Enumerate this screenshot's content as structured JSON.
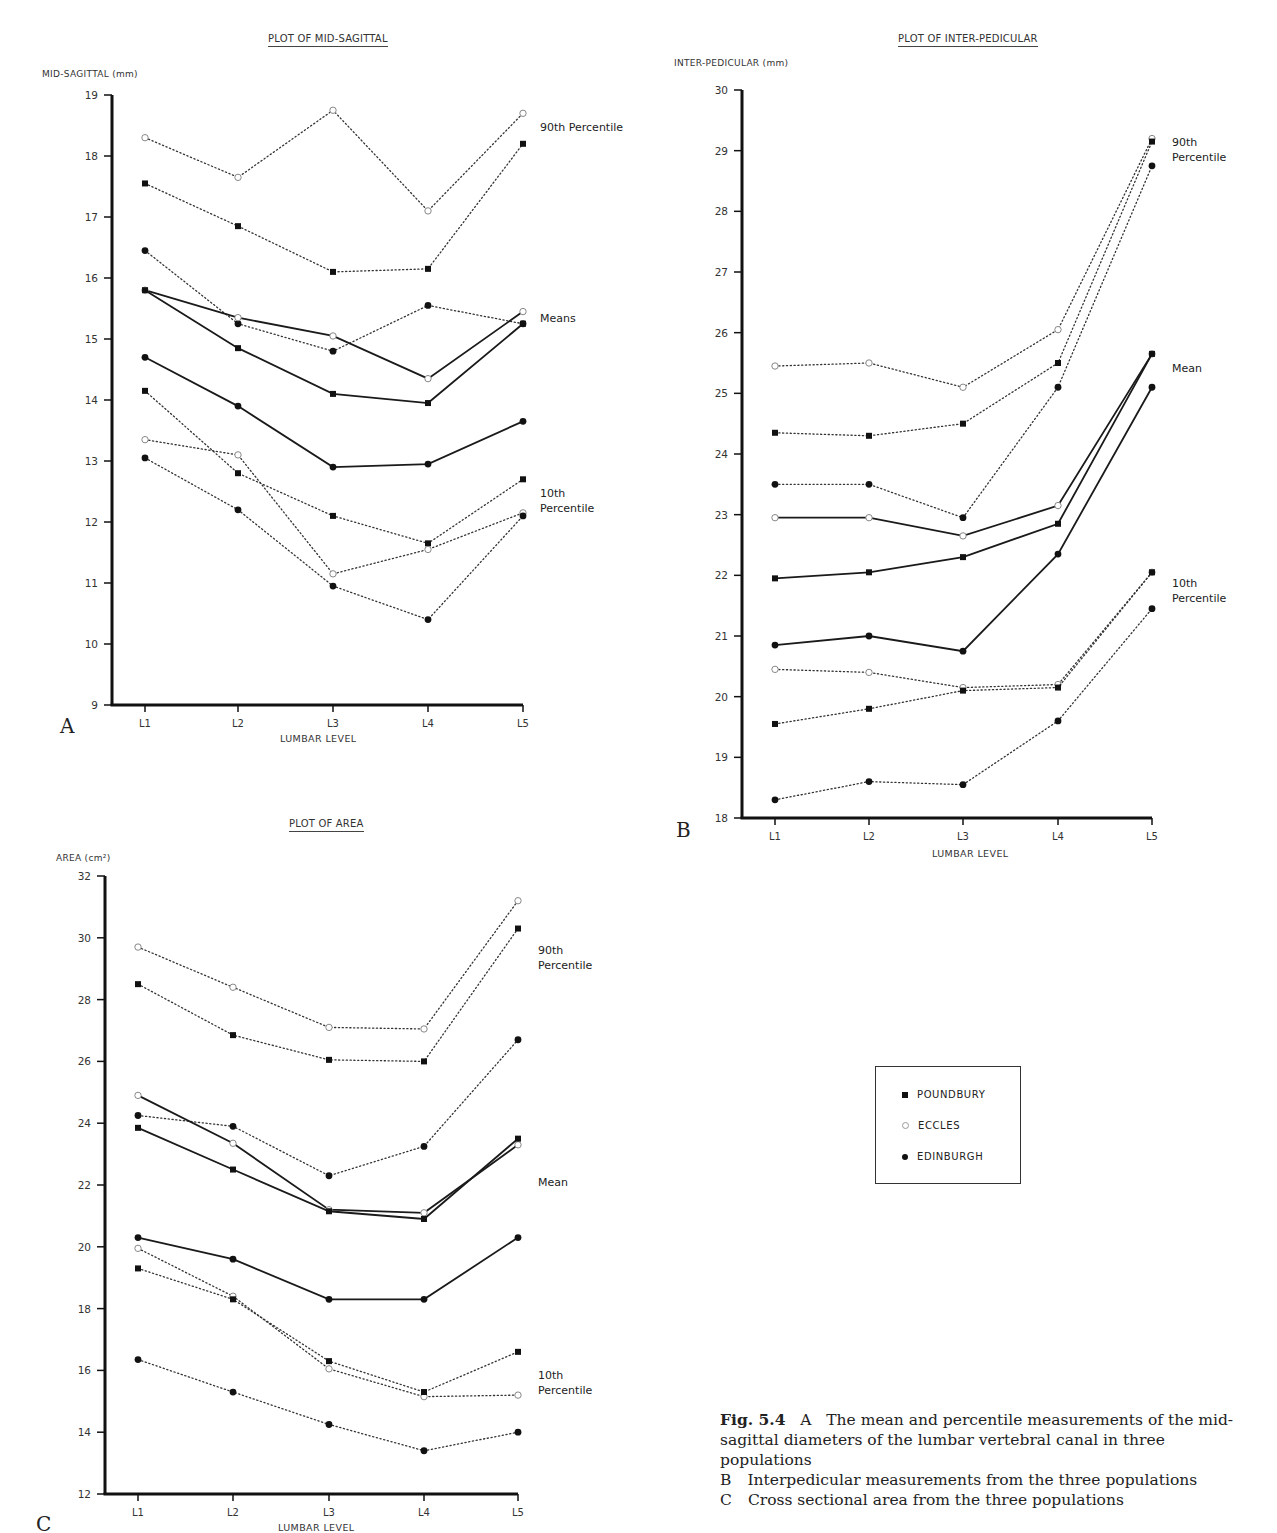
{
  "figure": {
    "caption": {
      "figure_label": "Fig. 5.4",
      "line_a_letter": "A",
      "line_a": "The mean and percentile measurements of the mid-sagittal diameters of the lumbar vertebral canal in three populations",
      "line_b_letter": "B",
      "line_b": "Interpedicular measurements from the three populations",
      "line_c_letter": "C",
      "line_c": "Cross sectional area from the three populations"
    },
    "legend": {
      "items": [
        {
          "label": "POUNDBURY",
          "marker": "filled-square"
        },
        {
          "label": "ECCLES",
          "marker": "open-circle"
        },
        {
          "label": "EDINBURGH",
          "marker": "filled-circle"
        }
      ]
    }
  },
  "chart_data": [
    {
      "id": "A",
      "type": "line",
      "title": "PLOT OF MID-SAGITTAL",
      "panel_letter": "A",
      "xlabel": "LUMBAR LEVEL",
      "ylabel": "MID-SAGITTAL (mm)",
      "categories": [
        "L1",
        "L2",
        "L3",
        "L4",
        "L5"
      ],
      "ylim": [
        9,
        19
      ],
      "yticks": [
        9,
        10,
        11,
        12,
        13,
        14,
        15,
        16,
        17,
        18,
        19
      ],
      "grid": false,
      "annotations": [
        {
          "text": "90th Percentile",
          "x": 540,
          "y": 120
        },
        {
          "text": "Means",
          "x": 540,
          "y": 311
        },
        {
          "text": "10th\nPercentile",
          "x": 540,
          "y": 486
        }
      ],
      "series": [
        {
          "name": "Eccles 90th Percentile",
          "population": "ECCLES",
          "stat": "90th",
          "style": "dotted",
          "marker": "open-circle",
          "values": [
            18.3,
            17.65,
            18.75,
            17.1,
            18.7
          ]
        },
        {
          "name": "Poundbury 90th Percentile",
          "population": "POUNDBURY",
          "stat": "90th",
          "style": "dotted",
          "marker": "filled-square",
          "values": [
            17.55,
            16.85,
            16.1,
            16.15,
            18.2
          ]
        },
        {
          "name": "Edinburgh 90th Percentile",
          "population": "EDINBURGH",
          "stat": "90th",
          "style": "dotted",
          "marker": "filled-circle",
          "values": [
            16.45,
            15.25,
            14.8,
            15.55,
            15.25
          ]
        },
        {
          "name": "Eccles Mean",
          "population": "ECCLES",
          "stat": "mean",
          "style": "solid",
          "marker": "open-circle",
          "values": [
            15.8,
            15.35,
            15.05,
            14.35,
            15.45
          ]
        },
        {
          "name": "Poundbury Mean",
          "population": "POUNDBURY",
          "stat": "mean",
          "style": "solid",
          "marker": "filled-square",
          "values": [
            15.8,
            14.85,
            14.1,
            13.95,
            15.25
          ]
        },
        {
          "name": "Edinburgh Mean",
          "population": "EDINBURGH",
          "stat": "mean",
          "style": "solid",
          "marker": "filled-circle",
          "values": [
            14.7,
            13.9,
            12.9,
            12.95,
            13.65
          ]
        },
        {
          "name": "Poundbury 10th Percentile",
          "population": "POUNDBURY",
          "stat": "10th",
          "style": "dotted",
          "marker": "filled-square",
          "values": [
            14.15,
            12.8,
            12.1,
            11.65,
            12.7
          ]
        },
        {
          "name": "Eccles 10th Percentile",
          "population": "ECCLES",
          "stat": "10th",
          "style": "dotted",
          "marker": "open-circle",
          "values": [
            13.35,
            13.1,
            11.15,
            11.55,
            12.15
          ]
        },
        {
          "name": "Edinburgh 10th Percentile",
          "population": "EDINBURGH",
          "stat": "10th",
          "style": "dotted",
          "marker": "filled-circle",
          "values": [
            13.05,
            12.2,
            10.95,
            10.4,
            12.1
          ]
        }
      ]
    },
    {
      "id": "B",
      "type": "line",
      "title": "PLOT OF INTER-PEDICULAR",
      "panel_letter": "B",
      "xlabel": "LUMBAR LEVEL",
      "ylabel": "INTER-PEDICULAR (mm)",
      "categories": [
        "L1",
        "L2",
        "L3",
        "L4",
        "L5"
      ],
      "ylim": [
        18,
        30
      ],
      "yticks": [
        18,
        19,
        20,
        21,
        22,
        23,
        24,
        25,
        26,
        27,
        28,
        29,
        30
      ],
      "grid": false,
      "annotations": [
        {
          "text": "90th\nPercentile",
          "x": 1172,
          "y": 135
        },
        {
          "text": "Mean",
          "x": 1172,
          "y": 361
        },
        {
          "text": "10th\nPercentile",
          "x": 1172,
          "y": 576
        }
      ],
      "series": [
        {
          "name": "Eccles 90th Percentile",
          "population": "ECCLES",
          "stat": "90th",
          "style": "dotted",
          "marker": "open-circle",
          "values": [
            25.45,
            25.5,
            25.1,
            26.05,
            29.2
          ]
        },
        {
          "name": "Poundbury 90th Percentile",
          "population": "POUNDBURY",
          "stat": "90th",
          "style": "dotted",
          "marker": "filled-square",
          "values": [
            24.35,
            24.3,
            24.5,
            25.5,
            29.15
          ]
        },
        {
          "name": "Edinburgh 90th Percentile",
          "population": "EDINBURGH",
          "stat": "90th",
          "style": "dotted",
          "marker": "filled-circle",
          "values": [
            23.5,
            23.5,
            22.95,
            25.1,
            28.75
          ]
        },
        {
          "name": "Eccles Mean",
          "population": "ECCLES",
          "stat": "mean",
          "style": "solid",
          "marker": "open-circle",
          "values": [
            22.95,
            22.95,
            22.65,
            23.15,
            25.65
          ]
        },
        {
          "name": "Poundbury Mean",
          "population": "POUNDBURY",
          "stat": "mean",
          "style": "solid",
          "marker": "filled-square",
          "values": [
            21.95,
            22.05,
            22.3,
            22.85,
            25.65
          ]
        },
        {
          "name": "Edinburgh Mean",
          "population": "EDINBURGH",
          "stat": "mean",
          "style": "solid",
          "marker": "filled-circle",
          "values": [
            20.85,
            21.0,
            20.75,
            22.35,
            25.1
          ]
        },
        {
          "name": "Eccles 10th Percentile",
          "population": "ECCLES",
          "stat": "10th",
          "style": "dotted",
          "marker": "open-circle",
          "values": [
            20.45,
            20.4,
            20.15,
            20.2,
            22.05
          ]
        },
        {
          "name": "Poundbury 10th Percentile",
          "population": "POUNDBURY",
          "stat": "10th",
          "style": "dotted",
          "marker": "filled-square",
          "values": [
            19.55,
            19.8,
            20.1,
            20.15,
            22.05
          ]
        },
        {
          "name": "Edinburgh 10th Percentile",
          "population": "EDINBURGH",
          "stat": "10th",
          "style": "dotted",
          "marker": "filled-circle",
          "values": [
            18.3,
            18.6,
            18.55,
            19.6,
            21.45
          ]
        }
      ]
    },
    {
      "id": "C",
      "type": "line",
      "title": "PLOT OF AREA",
      "panel_letter": "C",
      "xlabel": "LUMBAR LEVEL",
      "ylabel": "AREA (cm²)",
      "categories": [
        "L1",
        "L2",
        "L3",
        "L4",
        "L5"
      ],
      "ylim": [
        12,
        32
      ],
      "yticks": [
        12,
        14,
        16,
        18,
        20,
        22,
        24,
        26,
        28,
        30,
        32
      ],
      "grid": false,
      "annotations": [
        {
          "text": "90th\nPercentile",
          "x": 538,
          "y": 943
        },
        {
          "text": "Mean",
          "x": 538,
          "y": 1175
        },
        {
          "text": "10th\nPercentile",
          "x": 538,
          "y": 1368
        }
      ],
      "series": [
        {
          "name": "Eccles 90th Percentile",
          "population": "ECCLES",
          "stat": "90th",
          "style": "dotted",
          "marker": "open-circle",
          "values": [
            29.7,
            28.4,
            27.1,
            27.05,
            31.2
          ]
        },
        {
          "name": "Poundbury 90th Percentile",
          "population": "POUNDBURY",
          "stat": "90th",
          "style": "dotted",
          "marker": "filled-square",
          "values": [
            28.5,
            26.85,
            26.05,
            26.0,
            30.3
          ]
        },
        {
          "name": "Edinburgh 90th Percentile",
          "population": "EDINBURGH",
          "stat": "90th",
          "style": "dotted",
          "marker": "filled-circle",
          "values": [
            24.25,
            23.9,
            22.3,
            23.25,
            26.7
          ]
        },
        {
          "name": "Eccles Mean",
          "population": "ECCLES",
          "stat": "mean",
          "style": "solid",
          "marker": "open-circle",
          "values": [
            24.9,
            23.35,
            21.2,
            21.1,
            23.3
          ]
        },
        {
          "name": "Poundbury Mean",
          "population": "POUNDBURY",
          "stat": "mean",
          "style": "solid",
          "marker": "filled-square",
          "values": [
            23.85,
            22.5,
            21.15,
            20.9,
            23.5
          ]
        },
        {
          "name": "Edinburgh Mean",
          "population": "EDINBURGH",
          "stat": "mean",
          "style": "solid",
          "marker": "filled-circle",
          "values": [
            20.3,
            19.6,
            18.3,
            18.3,
            20.3
          ]
        },
        {
          "name": "Eccles 10th Percentile",
          "population": "ECCLES",
          "stat": "10th",
          "style": "dotted",
          "marker": "open-circle",
          "values": [
            19.95,
            18.4,
            16.05,
            15.15,
            15.2
          ]
        },
        {
          "name": "Poundbury 10th Percentile",
          "population": "POUNDBURY",
          "stat": "10th",
          "style": "dotted",
          "marker": "filled-square",
          "values": [
            19.3,
            18.3,
            16.3,
            15.3,
            16.6
          ]
        },
        {
          "name": "Edinburgh 10th Percentile",
          "population": "EDINBURGH",
          "stat": "10th",
          "style": "dotted",
          "marker": "filled-circle",
          "values": [
            16.35,
            15.3,
            14.25,
            13.4,
            14.0
          ]
        }
      ]
    }
  ],
  "layout": {
    "A": {
      "x0": 112,
      "x1": 523,
      "y_top": 95,
      "y_bot": 705,
      "xs": [
        145,
        238,
        333,
        428,
        523
      ],
      "title_x": 268,
      "title_y": 33,
      "ylabel_x": 42,
      "ylabel_y": 69,
      "xlabel_x": 280,
      "xlabel_y": 733,
      "letter_x": 60,
      "letter_y": 714
    },
    "B": {
      "x0": 742,
      "x1": 1152,
      "y_top": 90,
      "y_bot": 818,
      "xs": [
        775,
        869,
        963,
        1058,
        1152
      ],
      "title_x": 898,
      "title_y": 33,
      "ylabel_x": 674,
      "ylabel_y": 58,
      "xlabel_x": 932,
      "xlabel_y": 848,
      "letter_x": 676,
      "letter_y": 818
    },
    "C": {
      "x0": 105,
      "x1": 518,
      "y_top": 876,
      "y_bot": 1494,
      "xs": [
        138,
        233,
        329,
        424,
        518
      ],
      "title_x": 289,
      "title_y": 818,
      "ylabel_x": 56,
      "ylabel_y": 853,
      "xlabel_x": 278,
      "xlabel_y": 1522,
      "letter_x": 36,
      "letter_y": 1512
    }
  }
}
